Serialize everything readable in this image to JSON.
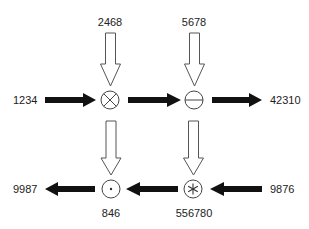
{
  "diagram": {
    "type": "operator-flow",
    "nodes": [
      {
        "id": "n1",
        "operator": "multiply",
        "symbol": "⊗",
        "x": 110,
        "y": 100
      },
      {
        "id": "n2",
        "operator": "minus",
        "symbol": "⊖",
        "x": 194,
        "y": 100
      },
      {
        "id": "n3",
        "operator": "dot",
        "symbol": "⊙",
        "x": 111,
        "y": 188
      },
      {
        "id": "n4",
        "operator": "star",
        "symbol": "⊛",
        "x": 193,
        "y": 189
      }
    ],
    "labels": {
      "top_left": "2468",
      "top_right": "5678",
      "mid_left": "1234",
      "mid_right": "42310",
      "bottom_left": "9987",
      "bottom_right": "9876",
      "below_dot": "846",
      "below_star": "556780"
    },
    "edges": [
      {
        "from": "2468",
        "to": "n1",
        "style": "hollow"
      },
      {
        "from": "5678",
        "to": "n2",
        "style": "hollow"
      },
      {
        "from": "1234",
        "to": "n1",
        "style": "solid"
      },
      {
        "from": "n1",
        "to": "n2",
        "style": "solid"
      },
      {
        "from": "n2",
        "to": "42310",
        "style": "solid"
      },
      {
        "from": "n1",
        "to": "n3",
        "style": "hollow"
      },
      {
        "from": "n2",
        "to": "n4",
        "style": "hollow"
      },
      {
        "from": "9876",
        "to": "n4",
        "style": "solid"
      },
      {
        "from": "n4",
        "to": "n3",
        "style": "solid"
      },
      {
        "from": "n3",
        "to": "9987",
        "style": "solid"
      }
    ],
    "colors": {
      "solid_arrow": "#111111",
      "hollow_arrow_stroke": "#555555",
      "circle_stroke": "#444444",
      "text": "#222222",
      "background": "#ffffff"
    }
  }
}
